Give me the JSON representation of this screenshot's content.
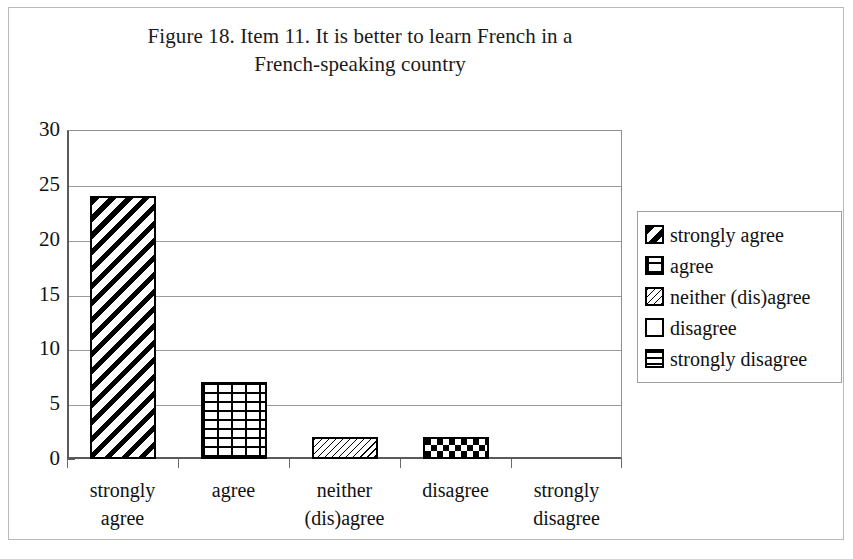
{
  "figure": {
    "title_lines": [
      "Figure 18. Item 11. It is better to learn French in a",
      "French-speaking country"
    ]
  },
  "chart_data": {
    "type": "bar",
    "title": "Figure 18. Item 11. It is better to learn French in a French-speaking country",
    "xlabel": "",
    "ylabel": "",
    "categories": [
      "strongly agree",
      "agree",
      "neither (dis)agree",
      "disagree",
      "strongly disagree"
    ],
    "category_lines": [
      [
        "strongly",
        "agree"
      ],
      [
        "agree"
      ],
      [
        "neither",
        "(dis)agree"
      ],
      [
        "disagree"
      ],
      [
        "strongly",
        "disagree"
      ]
    ],
    "values": [
      24,
      7,
      2,
      2,
      0
    ],
    "ylim": [
      0,
      30
    ],
    "ytick_labels": [
      "30",
      "25",
      "20",
      "15",
      "10",
      "5",
      "0"
    ],
    "ytick_values": [
      30,
      25,
      20,
      15,
      10,
      5,
      0
    ],
    "ytick_step": 5,
    "grid": true,
    "grid_axis": "y",
    "legend_position": "right",
    "bar_patterns": [
      "diagonal-stripes",
      "brick",
      "fine-hatch",
      "checkerboard",
      "horizontal-lines"
    ],
    "colors": {
      "bar_fill": "#ffffff",
      "bar_outline": "#000000",
      "gridline": "#9a9a9a",
      "axis": "#5a5a5a",
      "text": "#111111",
      "background": "#ffffff"
    }
  },
  "legend": {
    "items": [
      {
        "label": "strongly agree",
        "pattern": "diagonal-stripes"
      },
      {
        "label": "agree",
        "pattern": "brick"
      },
      {
        "label": "neither (dis)agree",
        "pattern": "fine-hatch"
      },
      {
        "label": "disagree",
        "pattern": "checkerboard"
      },
      {
        "label": "strongly disagree",
        "pattern": "horizontal-lines"
      }
    ]
  }
}
